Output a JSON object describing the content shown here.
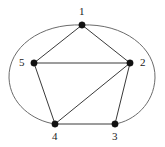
{
  "figure": {
    "kind": "undirected-graph-drawing",
    "background_color": "#ffffff",
    "width": 165,
    "height": 147
  },
  "style": {
    "edge_color": "#3a3a3a",
    "arc_color": "#6b6b6b",
    "vertex_color": "#111111",
    "label_color": "#1a1a1a",
    "vertex_radius": 3.2,
    "edge_width": 1
  },
  "graph": {
    "vertex_count": 5,
    "edge_count": 9,
    "vertices": [
      {
        "id": "1",
        "label": "1",
        "x": 82,
        "y": 25,
        "label_x": 79,
        "label_y": 6,
        "label_position": "above"
      },
      {
        "id": "2",
        "label": "2",
        "x": 130,
        "y": 63,
        "label_x": 140,
        "label_y": 57,
        "label_position": "right"
      },
      {
        "id": "3",
        "label": "3",
        "x": 115,
        "y": 124,
        "label_x": 112,
        "label_y": 131,
        "label_position": "below"
      },
      {
        "id": "4",
        "label": "4",
        "x": 55,
        "y": 124,
        "label_x": 52,
        "label_y": 131,
        "label_position": "below"
      },
      {
        "id": "5",
        "label": "5",
        "x": 34,
        "y": 63,
        "label_x": 19,
        "label_y": 57,
        "label_position": "left"
      }
    ],
    "edges": [
      {
        "id": "edge-1-5",
        "from": "1",
        "to": "5",
        "shape": "straight",
        "d": "M 82 25 L 34 63"
      },
      {
        "id": "edge-1-2",
        "from": "1",
        "to": "2",
        "shape": "straight",
        "d": "M 82 25 L 130 63"
      },
      {
        "id": "edge-5-2",
        "from": "5",
        "to": "2",
        "shape": "straight",
        "d": "M 34 63 L 130 63"
      },
      {
        "id": "edge-5-4",
        "from": "5",
        "to": "4",
        "shape": "straight",
        "d": "M 34 63 L 55 124"
      },
      {
        "id": "edge-4-3",
        "from": "4",
        "to": "3",
        "shape": "straight",
        "d": "M 55 124 L 115 124"
      },
      {
        "id": "edge-3-2",
        "from": "3",
        "to": "2",
        "shape": "straight",
        "d": "M 115 124 L 130 63"
      },
      {
        "id": "edge-4-2",
        "from": "4",
        "to": "2",
        "shape": "straight",
        "d": "M 55 124 L 130 63"
      },
      {
        "id": "edge-1-4",
        "from": "1",
        "to": "4",
        "shape": "arc-left",
        "d": "M 82 25 C 40 23 8 48 9 78 C 10 104 33 121 55 124"
      },
      {
        "id": "edge-1-3",
        "from": "1",
        "to": "3",
        "shape": "arc-right",
        "d": "M 82 25 C 124 23 156 48 155 78 C 154 104 134 121 115 124"
      }
    ],
    "adjacency": {
      "1": [
        "2",
        "3",
        "4",
        "5"
      ],
      "2": [
        "1",
        "3",
        "4",
        "5"
      ],
      "3": [
        "1",
        "2",
        "4"
      ],
      "4": [
        "1",
        "2",
        "3",
        "5"
      ],
      "5": [
        "1",
        "2",
        "4"
      ]
    }
  }
}
